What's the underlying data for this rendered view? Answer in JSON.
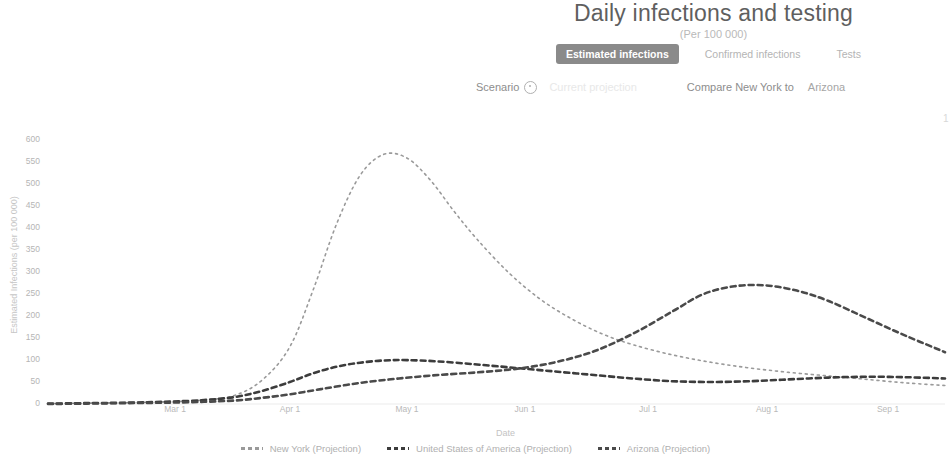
{
  "header": {
    "title": "Daily infections and testing",
    "subtitle": "(Per 100 000)",
    "tabs": [
      {
        "label": "Estimated infections",
        "active": true
      },
      {
        "label": "Confirmed infections",
        "active": false
      },
      {
        "label": "Tests",
        "active": false
      }
    ],
    "scenario_label": "Scenario",
    "info_icon": "info-circle-icon",
    "scenario_value": "Current projection",
    "compare_label": "Compare New York to",
    "compare_value": "Arizona",
    "corner_mark": "1"
  },
  "chart_data": {
    "type": "line",
    "title": "Daily infections and testing",
    "subtitle": "(Per 100 000)",
    "xlabel": "Date",
    "ylabel": "Estimated Infections (per 100 000)",
    "xticks": [
      "Mar 1",
      "Apr 1",
      "May 1",
      "Jun 1",
      "Jul 1",
      "Aug 1",
      "Sep 1"
    ],
    "xtick_positions": [
      175,
      290,
      407,
      525,
      648,
      767,
      888
    ],
    "yticks": [
      0,
      50,
      100,
      150,
      200,
      250,
      300,
      350,
      400,
      450,
      500,
      550,
      600
    ],
    "ylim": [
      0,
      610
    ],
    "xlim_days": [
      0,
      230
    ],
    "grid": false,
    "legend_position": "bottom",
    "line_style": "dashed",
    "series": [
      {
        "name": "New York (Projection)",
        "color": "#9a9a9a",
        "dash": "2,4",
        "width": 1.6,
        "x": [
          0,
          10,
          20,
          30,
          40,
          48,
          55,
          62,
          68,
          74,
          80,
          86,
          92,
          98,
          104,
          110,
          118,
          126,
          134,
          142,
          150,
          160,
          170,
          180,
          190,
          200,
          210,
          220,
          230
        ],
        "values": [
          1,
          2,
          3,
          5,
          9,
          20,
          55,
          130,
          260,
          410,
          520,
          568,
          560,
          510,
          440,
          375,
          300,
          240,
          195,
          160,
          135,
          112,
          95,
          82,
          72,
          64,
          56,
          48,
          42
        ]
      },
      {
        "name": "United States of America (Projection)",
        "color": "#3c3c3c",
        "dash": "5,4",
        "width": 2.6,
        "x": [
          0,
          10,
          20,
          30,
          40,
          48,
          55,
          62,
          68,
          74,
          80,
          86,
          92,
          100,
          110,
          120,
          130,
          140,
          150,
          160,
          170,
          180,
          190,
          200,
          210,
          220,
          230
        ],
        "values": [
          1,
          2,
          3,
          5,
          9,
          16,
          30,
          50,
          70,
          85,
          94,
          99,
          100,
          97,
          90,
          82,
          74,
          66,
          58,
          52,
          50,
          52,
          56,
          60,
          62,
          61,
          58
        ]
      },
      {
        "name": "Arizona (Projection)",
        "color": "#4a4a4a",
        "dash": "5,4",
        "width": 2.6,
        "x": [
          0,
          10,
          20,
          30,
          40,
          48,
          55,
          62,
          70,
          80,
          90,
          100,
          110,
          120,
          130,
          140,
          150,
          160,
          168,
          176,
          184,
          192,
          200,
          210,
          220,
          230
        ],
        "values": [
          0,
          1,
          2,
          3,
          5,
          8,
          14,
          22,
          34,
          48,
          58,
          66,
          72,
          80,
          95,
          120,
          160,
          210,
          250,
          268,
          270,
          258,
          235,
          195,
          155,
          118
        ]
      }
    ]
  }
}
